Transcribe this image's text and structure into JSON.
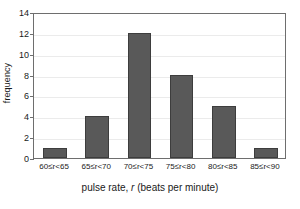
{
  "chart_data": {
    "type": "bar",
    "title": "",
    "xlabel": "pulse rate, r (beats per minute)",
    "ylabel": "frequency",
    "categories": [
      "60≤r<65",
      "65≤r<70",
      "70≤r<75",
      "75≤r<80",
      "80≤r<85",
      "85≤r<90"
    ],
    "values": [
      1,
      4,
      12,
      8,
      5,
      1
    ],
    "xlim": [
      60,
      90
    ],
    "ylim": [
      0,
      14
    ],
    "yticks": [
      0,
      2,
      4,
      6,
      8,
      10,
      12,
      14
    ],
    "ytick_labels": [
      "0",
      "2",
      "4",
      "6",
      "8",
      "10",
      "12",
      "14"
    ],
    "grid": "horizontal",
    "legend": "none",
    "bar_color": "#595959",
    "bar_edge_color": "#3d3d3d",
    "gridline_color": "#ebebeb",
    "axis_color": "#6e6e6e"
  },
  "axis_titles": {
    "x_prefix": "pulse rate, ",
    "x_variable": "r",
    "x_suffix": " (beats per minute)",
    "y": "frequency"
  }
}
